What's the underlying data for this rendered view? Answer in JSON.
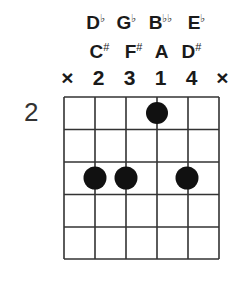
{
  "chord_diagram": {
    "start_fret_label": "2",
    "num_strings": 6,
    "num_frets_shown": 5,
    "flat_names": [
      {
        "string": 2,
        "base": "D",
        "accidental": "♭"
      },
      {
        "string": 3,
        "base": "G",
        "accidental": "♭"
      },
      {
        "string": 4,
        "base": "B",
        "accidental": "♭♭"
      },
      {
        "string": 5,
        "base": "E",
        "accidental": "♭"
      }
    ],
    "sharp_names": [
      {
        "string": 2,
        "base": "C",
        "accidental": "#"
      },
      {
        "string": 3,
        "base": "F",
        "accidental": "#"
      },
      {
        "string": 4,
        "base": "A",
        "accidental": ""
      },
      {
        "string": 5,
        "base": "D",
        "accidental": "#"
      }
    ],
    "fingering": [
      "×",
      "2",
      "3",
      "1",
      "4",
      "×"
    ],
    "dots": [
      {
        "string": 4,
        "fret": 1
      },
      {
        "string": 2,
        "fret": 3
      },
      {
        "string": 3,
        "fret": 3
      },
      {
        "string": 5,
        "fret": 3
      }
    ],
    "colors": {
      "grid": "#333333",
      "dot": "#111111",
      "text": "#1a1a1a"
    }
  }
}
